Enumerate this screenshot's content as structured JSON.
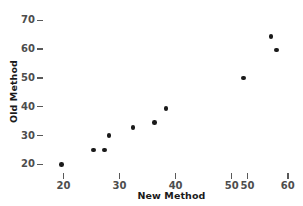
{
  "chart_data": {
    "type": "scatter",
    "title": "",
    "xlabel": "New Method",
    "ylabel": "Old Method",
    "xlim": [
      16.5,
      62.0
    ],
    "ylim": [
      17.5,
      71.5
    ],
    "grid": false,
    "legend": null,
    "x_tick_labels": [
      "20",
      "30",
      "40",
      "50",
      "50",
      "60"
    ],
    "x_tick_values": [
      20,
      30,
      40,
      50,
      52.8,
      60
    ],
    "y_tick_labels": [
      "20",
      "30",
      "40",
      "50",
      "60",
      "70"
    ],
    "y_tick_values": [
      20,
      30,
      40,
      50,
      60,
      70
    ],
    "marker": "filled-circle",
    "marker_color": "#1a1a1a",
    "axis_color": "#595959",
    "background_color": "#ffffff",
    "points": [
      {
        "x": 19.7,
        "y": 20.0
      },
      {
        "x": 25.4,
        "y": 25.0
      },
      {
        "x": 27.3,
        "y": 24.9
      },
      {
        "x": 28.1,
        "y": 30.0
      },
      {
        "x": 32.4,
        "y": 32.8
      },
      {
        "x": 36.2,
        "y": 34.5
      },
      {
        "x": 38.3,
        "y": 39.4
      },
      {
        "x": 52.1,
        "y": 50.0
      },
      {
        "x": 58.0,
        "y": 59.7
      },
      {
        "x": 57.0,
        "y": 64.4
      }
    ]
  }
}
